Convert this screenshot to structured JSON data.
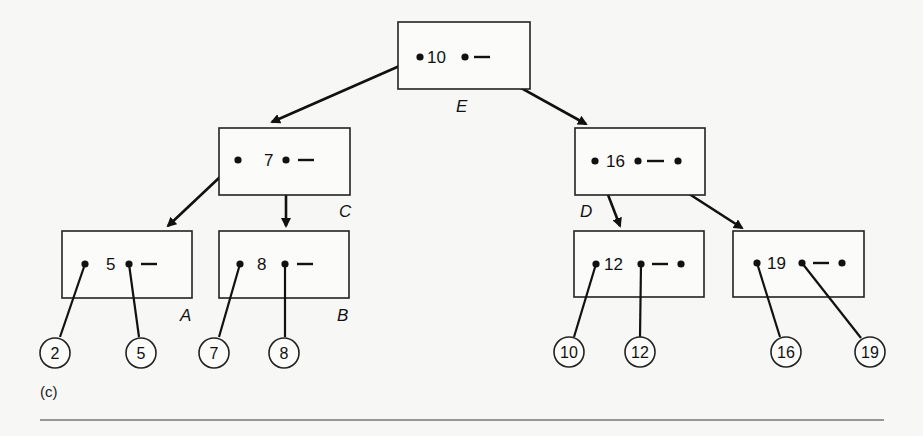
{
  "figure": {
    "caption": "(c)"
  },
  "nodes": {
    "E": {
      "label": "E",
      "key": "10",
      "trail": "—"
    },
    "C": {
      "label": "C",
      "key": "7",
      "trail": "—"
    },
    "D": {
      "label": "D",
      "key": "16",
      "trail": "—"
    },
    "A": {
      "label": "A",
      "key": "5",
      "trail": "—"
    },
    "B": {
      "label": "B",
      "key": "8",
      "trail": "—"
    },
    "L12": {
      "label": "",
      "key": "12",
      "trail": "—"
    },
    "L19": {
      "label": "",
      "key": "19",
      "trail": "—"
    }
  },
  "records": [
    "2",
    "5",
    "7",
    "8",
    "10",
    "12",
    "16",
    "19"
  ],
  "edges": [
    {
      "from": "E",
      "to": "C"
    },
    {
      "from": "E",
      "to": "D"
    },
    {
      "from": "C",
      "to": "A"
    },
    {
      "from": "C",
      "to": "B"
    },
    {
      "from": "D",
      "to": "L12"
    },
    {
      "from": "D",
      "to": "L19"
    },
    {
      "from": "A",
      "to": "record-2"
    },
    {
      "from": "A",
      "to": "record-5"
    },
    {
      "from": "B",
      "to": "record-7"
    },
    {
      "from": "B",
      "to": "record-8"
    },
    {
      "from": "L12",
      "to": "record-10"
    },
    {
      "from": "L12",
      "to": "record-12"
    },
    {
      "from": "L19",
      "to": "record-16"
    },
    {
      "from": "L19",
      "to": "record-19"
    }
  ],
  "colors": {
    "ink": "#111111",
    "background": "#f7f7f5",
    "rule": "#777777"
  }
}
